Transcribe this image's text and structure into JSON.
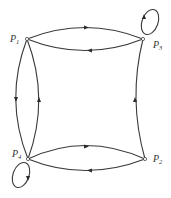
{
  "diagram": {
    "type": "directed-graph",
    "nodes": [
      {
        "id": "P1",
        "label": "P",
        "sub": "1",
        "x": 27,
        "y": 39
      },
      {
        "id": "P2",
        "label": "P",
        "sub": "2",
        "x": 145,
        "y": 159
      },
      {
        "id": "P3",
        "label": "P",
        "sub": "3",
        "x": 143,
        "y": 39
      },
      {
        "id": "P4",
        "label": "P",
        "sub": "4",
        "x": 28,
        "y": 159
      }
    ],
    "edges": [
      {
        "from": "P1",
        "to": "P3",
        "label": "upper arc"
      },
      {
        "from": "P3",
        "to": "P1",
        "label": "lower arc"
      },
      {
        "from": "P1",
        "to": "P4",
        "label": "left outer arc"
      },
      {
        "from": "P4",
        "to": "P1",
        "label": "left inner arc"
      },
      {
        "from": "P2",
        "to": "P3",
        "label": "right side"
      },
      {
        "from": "P4",
        "to": "P2",
        "label": "bottom upper arc"
      },
      {
        "from": "P2",
        "to": "P4",
        "label": "bottom lower arc"
      },
      {
        "from": "P3",
        "to": "P3",
        "label": "self-loop"
      },
      {
        "from": "P4",
        "to": "P4",
        "label": "self-loop"
      }
    ]
  }
}
